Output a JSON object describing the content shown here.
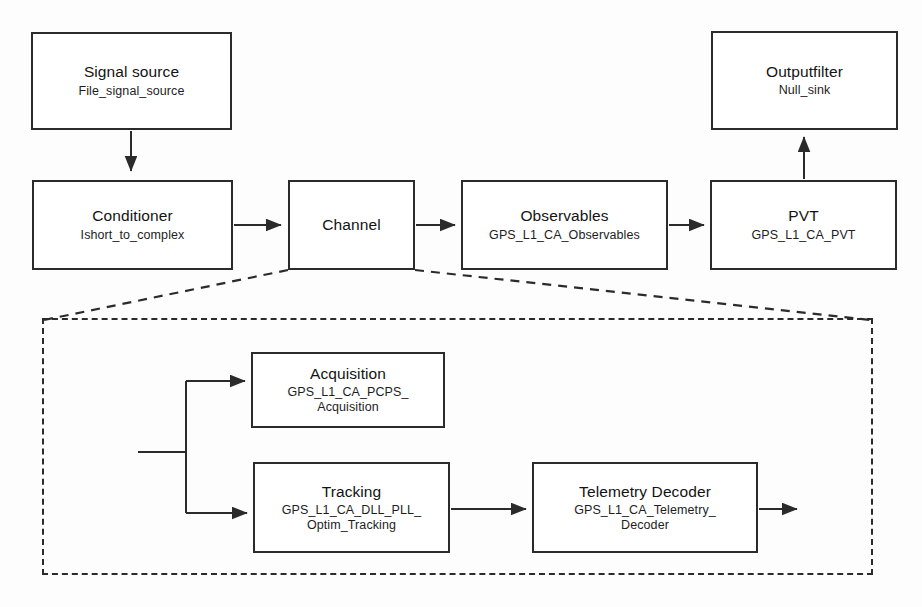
{
  "diagram": {
    "stroke_color": "#2b2b2b",
    "background_color": "#fdfdfd"
  },
  "blocks": {
    "signal_source": {
      "title": "Signal source",
      "sub1": "File_signal_source",
      "sub2": ""
    },
    "conditioner": {
      "title": "Conditioner",
      "sub1": "Ishort_to_complex",
      "sub2": ""
    },
    "channel": {
      "title": "Channel",
      "sub1": "",
      "sub2": ""
    },
    "observables": {
      "title": "Observables",
      "sub1": "GPS_L1_CA_Observables",
      "sub2": ""
    },
    "pvt": {
      "title": "PVT",
      "sub1": "GPS_L1_CA_PVT",
      "sub2": ""
    },
    "output_filter": {
      "title": "Outputfilter",
      "sub1": "Null_sink",
      "sub2": ""
    },
    "acquisition": {
      "title": "Acquisition",
      "sub1": "GPS_L1_CA_PCPS_",
      "sub2": "Acquisition"
    },
    "tracking": {
      "title": "Tracking",
      "sub1": "GPS_L1_CA_DLL_PLL_",
      "sub2": "Optim_Tracking"
    },
    "telemetry": {
      "title": "Telemetry Decoder",
      "sub1": "GPS_L1_CA_Telemetry_",
      "sub2": "Decoder"
    }
  },
  "panel": {
    "name": "channel-detail",
    "style": "dashed"
  },
  "connections": [
    {
      "name": "signal-source-to-conditioner",
      "from": "signal_source",
      "to": "conditioner",
      "direction": "down"
    },
    {
      "name": "conditioner-to-channel",
      "from": "conditioner",
      "to": "channel",
      "direction": "right"
    },
    {
      "name": "channel-to-observables",
      "from": "channel",
      "to": "observables",
      "direction": "right"
    },
    {
      "name": "observables-to-pvt",
      "from": "observables",
      "to": "pvt",
      "direction": "right"
    },
    {
      "name": "pvt-to-output-filter",
      "from": "pvt",
      "to": "output_filter",
      "direction": "up"
    },
    {
      "name": "channel-input-split",
      "from": "channel_input",
      "to": "acquisition_and_tracking",
      "direction": "split"
    },
    {
      "name": "split-to-acquisition",
      "from": "split",
      "to": "acquisition",
      "direction": "right"
    },
    {
      "name": "split-to-tracking",
      "from": "split",
      "to": "tracking",
      "direction": "right"
    },
    {
      "name": "tracking-to-telemetry",
      "from": "tracking",
      "to": "telemetry",
      "direction": "right"
    },
    {
      "name": "telemetry-output",
      "from": "telemetry",
      "to": "channel_output",
      "direction": "right"
    }
  ]
}
